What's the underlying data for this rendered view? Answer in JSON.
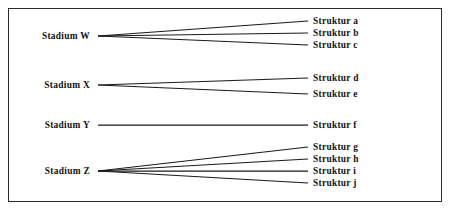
{
  "figure": {
    "frame": {
      "x": 8,
      "y": 8,
      "width": 434,
      "height": 194,
      "border_color": "#2b2b2b",
      "background_color": "#ffffff"
    },
    "line_color": "#1a1a1a",
    "text_color": "#111111"
  },
  "chart_data": {
    "type": "diagram",
    "subtype": "bipartite-mapping",
    "title": "",
    "left_nodes": [
      {
        "id": "W",
        "label": "Stadium W",
        "x": 98,
        "y": 36
      },
      {
        "id": "X",
        "label": "Stadium X",
        "x": 98,
        "y": 85
      },
      {
        "id": "Y",
        "label": "Stadium Y",
        "x": 98,
        "y": 125
      },
      {
        "id": "Z",
        "label": "Stadium Z",
        "x": 98,
        "y": 171
      }
    ],
    "right_nodes": [
      {
        "id": "a",
        "label": "Struktur a",
        "x": 308,
        "y": 21
      },
      {
        "id": "b",
        "label": "Struktur b",
        "x": 308,
        "y": 33
      },
      {
        "id": "c",
        "label": "Struktur c",
        "x": 308,
        "y": 45
      },
      {
        "id": "d",
        "label": "Struktur d",
        "x": 308,
        "y": 78
      },
      {
        "id": "e",
        "label": "Struktur e",
        "x": 308,
        "y": 94
      },
      {
        "id": "f",
        "label": "Struktur f",
        "x": 308,
        "y": 125
      },
      {
        "id": "g",
        "label": "Struktur g",
        "x": 308,
        "y": 147
      },
      {
        "id": "h",
        "label": "Struktur h",
        "x": 308,
        "y": 159
      },
      {
        "id": "i",
        "label": "Struktur i",
        "x": 308,
        "y": 171
      },
      {
        "id": "j",
        "label": "Struktur j",
        "x": 308,
        "y": 183
      }
    ],
    "edges": [
      {
        "from": "W",
        "to": "a"
      },
      {
        "from": "W",
        "to": "b"
      },
      {
        "from": "W",
        "to": "c"
      },
      {
        "from": "X",
        "to": "d"
      },
      {
        "from": "X",
        "to": "e"
      },
      {
        "from": "Y",
        "to": "f"
      },
      {
        "from": "Z",
        "to": "g"
      },
      {
        "from": "Z",
        "to": "h"
      },
      {
        "from": "Z",
        "to": "i"
      },
      {
        "from": "Z",
        "to": "j"
      }
    ],
    "edge_counts": {
      "W": 3,
      "X": 2,
      "Y": 1,
      "Z": 4
    },
    "label_offset_x": 5,
    "node_label_gap": 8
  }
}
